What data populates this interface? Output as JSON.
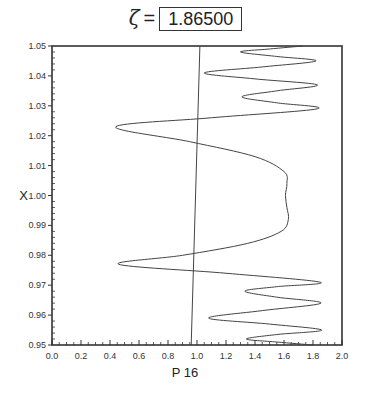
{
  "title": {
    "symbol": "ζ",
    "equals": "=",
    "value": "1.86500"
  },
  "chart_data": {
    "type": "line",
    "xlabel": "P 16",
    "ylabel": "X",
    "xlim": [
      0.0,
      2.0
    ],
    "ylim": [
      0.95,
      1.05
    ],
    "xticks": [
      "0.0",
      "0.2",
      "0.4",
      "0.6",
      "0.8",
      "1.0",
      "1.2",
      "1.4",
      "1.6",
      "1.8",
      "2.0"
    ],
    "yticks": [
      "0.95",
      "0.96",
      "0.97",
      "0.98",
      "0.99",
      "1.00",
      "1.01",
      "1.02",
      "1.03",
      "1.04",
      "1.05"
    ],
    "grid": false,
    "series": [
      {
        "name": "P16 profile",
        "points": [
          [
            1.8,
            0.95
          ],
          [
            1.55,
            0.951
          ],
          [
            1.34,
            0.952
          ],
          [
            1.55,
            0.9535
          ],
          [
            1.86,
            0.955
          ],
          [
            1.5,
            0.957
          ],
          [
            1.08,
            0.959
          ],
          [
            1.45,
            0.9615
          ],
          [
            1.855,
            0.964
          ],
          [
            1.55,
            0.966
          ],
          [
            1.33,
            0.968
          ],
          [
            1.55,
            0.9695
          ],
          [
            1.85,
            0.971
          ],
          [
            1.2,
            0.974
          ],
          [
            0.46,
            0.977
          ],
          [
            0.9,
            0.98
          ],
          [
            1.35,
            0.984
          ],
          [
            1.58,
            0.988
          ],
          [
            1.63,
            0.992
          ],
          [
            1.62,
            0.996
          ],
          [
            1.61,
            1.0
          ],
          [
            1.62,
            1.004
          ],
          [
            1.6,
            1.008
          ],
          [
            1.4,
            1.013
          ],
          [
            0.95,
            1.018
          ],
          [
            0.44,
            1.023
          ],
          [
            1.1,
            1.026
          ],
          [
            1.83,
            1.029
          ],
          [
            1.55,
            1.031
          ],
          [
            1.31,
            1.033
          ],
          [
            1.55,
            1.035
          ],
          [
            1.83,
            1.037
          ],
          [
            1.4,
            1.039
          ],
          [
            1.05,
            1.041
          ],
          [
            1.45,
            1.043
          ],
          [
            1.82,
            1.045
          ],
          [
            1.55,
            1.0465
          ],
          [
            1.3,
            1.048
          ],
          [
            1.5,
            1.049
          ],
          [
            1.73,
            1.05
          ]
        ]
      },
      {
        "name": "reference line",
        "points": [
          [
            0.96,
            0.95
          ],
          [
            1.02,
            1.05
          ]
        ]
      }
    ]
  }
}
